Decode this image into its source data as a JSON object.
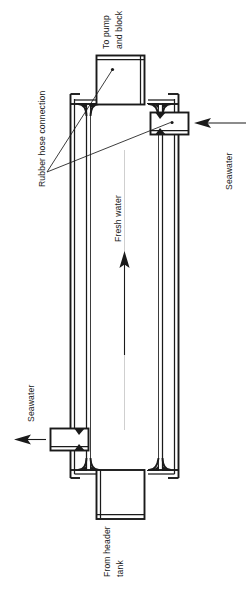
{
  "figure": {
    "orientation": "rotated-90",
    "background_color": "#ffffff",
    "line_color": "#1a1a1a"
  },
  "labels": {
    "to_pump_and_block_line1": "To pump",
    "to_pump_and_block_line2": "and block",
    "rubber_hose_connection": "Rubber hose connection",
    "seawater_inlet": "Seawater",
    "seawater_outlet": "Seawater",
    "fresh_water": "Fresh water",
    "from_header_tank_line1": "From header",
    "from_header_tank_line2": "tank"
  },
  "components": {
    "top_header_box": "To pump and block connection box",
    "bottom_header_box": "From header tank connection box",
    "seawater_inlet_port": "Seawater inlet port",
    "seawater_outlet_port": "Seawater outlet port",
    "shell": "Outer shell casing",
    "tube_bundle": "Inner tube bundle",
    "flow_arrow": "Fresh water flow direction arrow"
  },
  "icons": {
    "flow_arrow_icon": "arrow-up-icon",
    "seawater_inlet_arrow_icon": "arrow-left-icon",
    "seawater_outlet_arrow_icon": "arrow-left-icon",
    "leader_dot_icon": "leader-dot-icon"
  }
}
